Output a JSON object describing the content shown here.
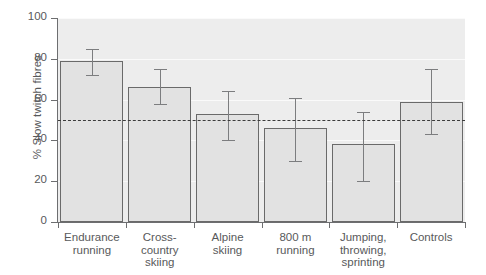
{
  "chart_data": {
    "type": "bar",
    "title": "",
    "xlabel": "",
    "ylabel": "% Slow twitch fibres",
    "ylim": [
      0,
      100
    ],
    "yticks": [
      0,
      20,
      40,
      60,
      80,
      100
    ],
    "grid": true,
    "legend": "none",
    "categories": [
      "Endurance running",
      "Cross-country skiing",
      "Alpine skiing",
      "800 m running",
      "Jumping, throwing, sprinting",
      "Controls"
    ],
    "category_lines": [
      [
        "Endurance",
        "running"
      ],
      [
        "Cross-",
        "country",
        "skiing"
      ],
      [
        "Alpine",
        "skiing"
      ],
      [
        "800 m",
        "running"
      ],
      [
        "Jumping,",
        "throwing,",
        "sprinting"
      ],
      [
        "Controls"
      ]
    ],
    "values": [
      79,
      66,
      53,
      46,
      38,
      59
    ],
    "error_low": [
      72,
      58,
      40,
      30,
      20,
      43
    ],
    "error_high": [
      85,
      75,
      64,
      61,
      54,
      75
    ],
    "reference_line": {
      "value": 50,
      "style": "dashed",
      "color": "#3c3c3c"
    },
    "colors": {
      "bar_fill": "#e2e2e2",
      "bar_edge": "#6a6a6a",
      "panel_background": "#ededed",
      "error_bar": "#7c7d7f",
      "axis": "#6d6e70",
      "text": "#58595b",
      "gridline": "#fafafa"
    }
  }
}
